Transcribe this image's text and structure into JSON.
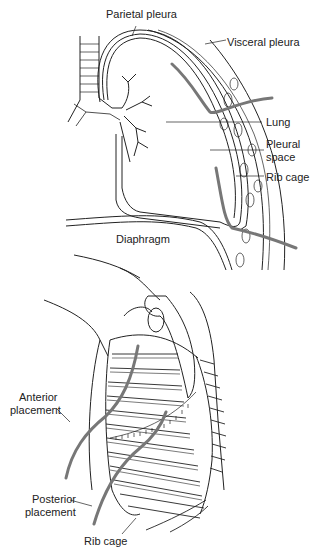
{
  "figure": {
    "top_panel": {
      "labels": {
        "parietal_pleura": "Parietal pleura",
        "visceral_pleura": "Visceral pleura",
        "lung": "Lung",
        "pleural_space_1": "Pleural",
        "pleural_space_2": "space",
        "rib_cage": "Rib cage",
        "diaphragm": "Diaphragm"
      }
    },
    "bottom_panel": {
      "labels": {
        "anterior_1": "Anterior",
        "anterior_2": "placement",
        "posterior_1": "Posterior",
        "posterior_2": "placement",
        "rib_cage": "Rib cage"
      }
    },
    "colors": {
      "line": "#222222",
      "tube": "#7a7a7a",
      "background": "#ffffff"
    }
  }
}
